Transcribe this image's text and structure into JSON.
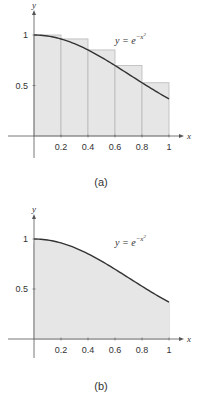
{
  "chart_data": [
    {
      "type": "area",
      "panel": "a",
      "caption": "(a)",
      "function_label": "y = e^{-x^2}",
      "function_label_parts": {
        "lhs": "y = e",
        "exp": "−x",
        "exp_sup": "2"
      },
      "xlabel": "x",
      "ylabel": "y",
      "xlim": [
        0,
        1.08
      ],
      "ylim": [
        0,
        1.15
      ],
      "x_ticks": [
        0.2,
        0.4,
        0.6,
        0.8,
        1
      ],
      "x_tick_labels": [
        "0.2",
        "0.4",
        "0.6",
        "0.8",
        "1"
      ],
      "y_ticks": [
        0.5,
        1
      ],
      "y_tick_labels": [
        "0.5",
        "1"
      ],
      "rectangles": {
        "rule": "left",
        "x_intervals": [
          [
            0,
            0.2
          ],
          [
            0.2,
            0.4
          ],
          [
            0.4,
            0.6
          ],
          [
            0.6,
            0.8
          ],
          [
            0.8,
            1.0
          ]
        ],
        "heights": [
          1.0,
          0.961,
          0.852,
          0.698,
          0.527
        ]
      },
      "curve": {
        "expr": "exp(-x^2)",
        "domain": [
          0,
          1
        ]
      },
      "grid": false,
      "legend": "none"
    },
    {
      "type": "area",
      "panel": "b",
      "caption": "(b)",
      "function_label": "y = e^{-x^2}",
      "function_label_parts": {
        "lhs": "y = e",
        "exp": "−x",
        "exp_sup": "2"
      },
      "xlabel": "x",
      "ylabel": "y",
      "xlim": [
        0,
        1.08
      ],
      "ylim": [
        0,
        1.15
      ],
      "x_ticks": [
        0.2,
        0.4,
        0.6,
        0.8,
        1
      ],
      "x_tick_labels": [
        "0.2",
        "0.4",
        "0.6",
        "0.8",
        "1"
      ],
      "y_ticks": [
        0.5,
        1
      ],
      "y_tick_labels": [
        "0.5",
        "1"
      ],
      "rectangles": {
        "rule": "right",
        "x_intervals": [
          [
            0,
            0.2
          ],
          [
            0.2,
            0.4
          ],
          [
            0.4,
            0.6
          ],
          [
            0.6,
            0.8
          ],
          [
            0.8,
            1.0
          ]
        ],
        "heights": [
          0.961,
          0.852,
          0.698,
          0.527,
          0.368
        ]
      },
      "curve": {
        "expr": "exp(-x^2)",
        "domain": [
          0,
          1
        ]
      },
      "grid": false,
      "legend": "none"
    }
  ],
  "colors": {
    "fill": "#e6e6e6",
    "rect_stroke": "#b8b8b8",
    "curve": "#333333",
    "axis": "#555555",
    "text": "#333333"
  }
}
